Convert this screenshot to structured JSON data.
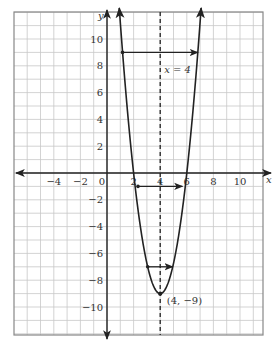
{
  "chart_data": {
    "type": "line",
    "title": "",
    "xlabel": "x",
    "ylabel": "y",
    "xlim": [
      -7,
      11.5
    ],
    "ylim": [
      -12,
      12
    ],
    "grid": true,
    "x_ticks": [
      -4,
      -2,
      0,
      2,
      4,
      6,
      8,
      10
    ],
    "y_ticks": [
      -10,
      -8,
      -6,
      -4,
      -2,
      2,
      4,
      6,
      8,
      10
    ],
    "series": [
      {
        "name": "parabola",
        "equation": "y = 2.25(x - 4)^2 - 9",
        "vertex": [
          4,
          -9
        ],
        "x_intercepts": [
          2,
          6
        ]
      }
    ],
    "axis_of_symmetry": {
      "x": 4,
      "label": "x = 4"
    },
    "annotations": [
      {
        "text": "(4, −9)",
        "point": [
          4,
          -9
        ]
      },
      {
        "text": "x = 4",
        "point": [
          4.3,
          7.5
        ]
      }
    ],
    "horizontal_arrows": [
      {
        "y": 9,
        "from_x": 1.17,
        "to_x": 6.83
      },
      {
        "y": -1,
        "from_x": 2.33,
        "to_x": 5.67
      },
      {
        "y": -7,
        "from_x": 3.06,
        "to_x": 4.94
      }
    ]
  },
  "labels": {
    "x_axis": "x",
    "y_axis": "y",
    "symmetry": "x = 4",
    "vertex": "(4, −9)",
    "zero": "0"
  }
}
